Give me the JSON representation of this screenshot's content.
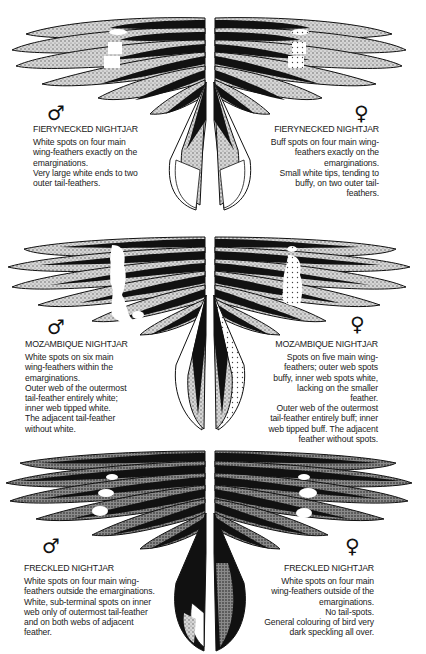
{
  "page": {
    "title_fragment": "",
    "plates": [
      {
        "species": "FIERYNECKED NIGHTJAR",
        "male": {
          "symbol": "♂",
          "name": "FIERYNECKED NIGHTJAR",
          "lines": [
            "White spots on four main",
            "wing-feathers exactly on the",
            "emarginations.",
            "Very large white ends to two",
            "outer tail-feathers."
          ]
        },
        "female": {
          "symbol": "♀",
          "name": "FIERYNECKED NIGHTJAR",
          "lines": [
            "Buff spots on four main wing-",
            "feathers exactly on the",
            "emarginations.",
            "Small white tips, tending to",
            "buffy, on two outer tail-",
            "feathers."
          ]
        }
      },
      {
        "species": "MOZAMBIQUE NIGHTJAR",
        "male": {
          "symbol": "♂",
          "name": "MOZAMBIQUE NIGHTJAR",
          "lines": [
            "White spots on six main",
            "wing-feathers within the",
            "emarginations.",
            "Outer web of the outermost",
            "tail-feather entirely white;",
            "inner web tipped white.",
            "The adjacent tail-feather",
            "without white."
          ]
        },
        "female": {
          "symbol": "♀",
          "name": "MOZAMBIQUE NIGHTJAR",
          "lines": [
            "Spots on five main wing-",
            "feathers; outer web spots",
            "buffy, inner web spots white,",
            "lacking on the smaller",
            "feather.",
            "Outer web of the outermost",
            "tail-feather entirely buff; inner",
            "web tipped buff. The adjacent",
            "feather without spots."
          ]
        }
      },
      {
        "species": "FRECKLED NIGHTJAR",
        "male": {
          "symbol": "♂",
          "name": "FRECKLED NIGHTJAR",
          "lines": [
            "White spots on four main wing-",
            "feathers outside the emarginations.",
            "White, sub-terminal spots on inner",
            "web only of outermost tail-feather",
            "and on both webs of adjacent",
            "feather."
          ]
        },
        "female": {
          "symbol": "♀",
          "name": "FRECKLED NIGHTJAR",
          "lines": [
            "White spots on four main",
            "wing-feathers outside of the",
            "emarginations.",
            "No tail-spots.",
            "General colouring of bird very",
            "dark speckling all over."
          ]
        }
      }
    ]
  },
  "colors": {
    "ink": "#111111",
    "stipple": "#bdbdbd",
    "paper": "#ffffff"
  }
}
